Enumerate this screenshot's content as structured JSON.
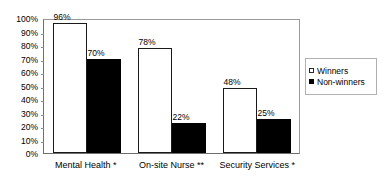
{
  "chart_data": {
    "type": "bar",
    "title": "",
    "subtitle": "",
    "xlabel": "",
    "ylabel": "",
    "ylim": [
      0,
      100
    ],
    "ytick_labels": [
      "100%",
      "90%",
      "80%",
      "70%",
      "60%",
      "50%",
      "40%",
      "30%",
      "20%",
      "10%",
      "0%"
    ],
    "ytick_values": [
      100,
      90,
      80,
      70,
      60,
      50,
      40,
      30,
      20,
      10,
      0
    ],
    "grid": false,
    "legend_position": "right",
    "categories": [
      "Mental Health *",
      "On-site Nurse **",
      "Security Services *"
    ],
    "series": [
      {
        "name": "Winners",
        "color": "#ffffff",
        "values": [
          96,
          78,
          48
        ],
        "data_labels": [
          "96%",
          "78%",
          "48%"
        ]
      },
      {
        "name": "Non-winners",
        "color": "#000000",
        "values": [
          70,
          22,
          25
        ],
        "data_labels": [
          "70%",
          "22%",
          "25%"
        ]
      }
    ]
  },
  "legend": {
    "items": [
      {
        "label": "Winners",
        "swatch": "hollow-square-icon"
      },
      {
        "label": "Non-winners",
        "swatch": "filled-square-icon"
      }
    ]
  }
}
